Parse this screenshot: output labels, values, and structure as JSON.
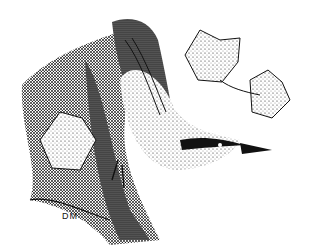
{
  "image": {
    "subject": "stipple ink drawing of a nuthatch on a tree trunk with ivy leaves",
    "signature": "DM",
    "colors": {
      "ink": "#111111",
      "paper": "#ffffff"
    }
  }
}
